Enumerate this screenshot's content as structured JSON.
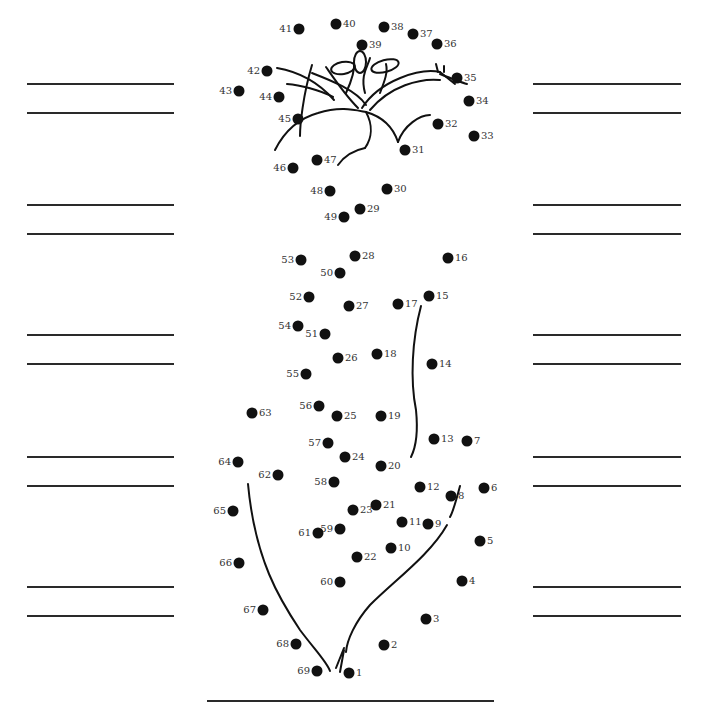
{
  "worksheet": {
    "answer_lines": {
      "left": {
        "x1": 27,
        "x2": 174,
        "ys": [
          84,
          113,
          205,
          234,
          335,
          364,
          457,
          486,
          587,
          616
        ]
      },
      "right": {
        "x1": 533,
        "x2": 681,
        "ys": [
          84,
          113,
          205,
          234,
          335,
          364,
          457,
          486,
          587,
          616
        ]
      },
      "bottom": {
        "x1": 207,
        "x2": 494,
        "y": 701
      }
    },
    "dots": [
      {
        "n": "1",
        "x": 349,
        "y": 673,
        "side": "r"
      },
      {
        "n": "2",
        "x": 384,
        "y": 645,
        "side": "r"
      },
      {
        "n": "3",
        "x": 426,
        "y": 619,
        "side": "r"
      },
      {
        "n": "4",
        "x": 462,
        "y": 581,
        "side": "r"
      },
      {
        "n": "5",
        "x": 480,
        "y": 541,
        "side": "r"
      },
      {
        "n": "6",
        "x": 484,
        "y": 488,
        "side": "r"
      },
      {
        "n": "7",
        "x": 467,
        "y": 441,
        "side": "r"
      },
      {
        "n": "8",
        "x": 451,
        "y": 496,
        "side": "r"
      },
      {
        "n": "9",
        "x": 428,
        "y": 524,
        "side": "r"
      },
      {
        "n": "10",
        "x": 391,
        "y": 548,
        "side": "r"
      },
      {
        "n": "11",
        "x": 402,
        "y": 522,
        "side": "r"
      },
      {
        "n": "12",
        "x": 420,
        "y": 487,
        "side": "r"
      },
      {
        "n": "13",
        "x": 434,
        "y": 439,
        "side": "r"
      },
      {
        "n": "14",
        "x": 432,
        "y": 364,
        "side": "r"
      },
      {
        "n": "15",
        "x": 429,
        "y": 296,
        "side": "r"
      },
      {
        "n": "16",
        "x": 448,
        "y": 258,
        "side": "r"
      },
      {
        "n": "17",
        "x": 398,
        "y": 304,
        "side": "r"
      },
      {
        "n": "18",
        "x": 377,
        "y": 354,
        "side": "r"
      },
      {
        "n": "19",
        "x": 381,
        "y": 416,
        "side": "r"
      },
      {
        "n": "20",
        "x": 381,
        "y": 466,
        "side": "r"
      },
      {
        "n": "21",
        "x": 376,
        "y": 505,
        "side": "r"
      },
      {
        "n": "22",
        "x": 357,
        "y": 557,
        "side": "r"
      },
      {
        "n": "23",
        "x": 353,
        "y": 510,
        "side": "r"
      },
      {
        "n": "24",
        "x": 345,
        "y": 457,
        "side": "r"
      },
      {
        "n": "25",
        "x": 337,
        "y": 416,
        "side": "r"
      },
      {
        "n": "26",
        "x": 338,
        "y": 358,
        "side": "r"
      },
      {
        "n": "27",
        "x": 349,
        "y": 306,
        "side": "r"
      },
      {
        "n": "28",
        "x": 355,
        "y": 256,
        "side": "r"
      },
      {
        "n": "29",
        "x": 360,
        "y": 209,
        "side": "r"
      },
      {
        "n": "30",
        "x": 387,
        "y": 189,
        "side": "r"
      },
      {
        "n": "31",
        "x": 405,
        "y": 150,
        "side": "r"
      },
      {
        "n": "32",
        "x": 438,
        "y": 124,
        "side": "r"
      },
      {
        "n": "33",
        "x": 474,
        "y": 136,
        "side": "r"
      },
      {
        "n": "34",
        "x": 469,
        "y": 101,
        "side": "r"
      },
      {
        "n": "35",
        "x": 457,
        "y": 78,
        "side": "r"
      },
      {
        "n": "36",
        "x": 437,
        "y": 44,
        "side": "r"
      },
      {
        "n": "37",
        "x": 413,
        "y": 34,
        "side": "r"
      },
      {
        "n": "38",
        "x": 384,
        "y": 27,
        "side": "r"
      },
      {
        "n": "39",
        "x": 362,
        "y": 45,
        "side": "r"
      },
      {
        "n": "40",
        "x": 336,
        "y": 24,
        "side": "r"
      },
      {
        "n": "41",
        "x": 299,
        "y": 29,
        "side": "l"
      },
      {
        "n": "42",
        "x": 267,
        "y": 71,
        "side": "l"
      },
      {
        "n": "43",
        "x": 239,
        "y": 91,
        "side": "l"
      },
      {
        "n": "44",
        "x": 279,
        "y": 97,
        "side": "l"
      },
      {
        "n": "45",
        "x": 298,
        "y": 119,
        "side": "l"
      },
      {
        "n": "46",
        "x": 293,
        "y": 168,
        "side": "l"
      },
      {
        "n": "47",
        "x": 317,
        "y": 160,
        "side": "r"
      },
      {
        "n": "48",
        "x": 330,
        "y": 191,
        "side": "l"
      },
      {
        "n": "49",
        "x": 344,
        "y": 217,
        "side": "l"
      },
      {
        "n": "50",
        "x": 340,
        "y": 273,
        "side": "l"
      },
      {
        "n": "51",
        "x": 325,
        "y": 334,
        "side": "l"
      },
      {
        "n": "52",
        "x": 309,
        "y": 297,
        "side": "l"
      },
      {
        "n": "53",
        "x": 301,
        "y": 260,
        "side": "l"
      },
      {
        "n": "54",
        "x": 298,
        "y": 326,
        "side": "l"
      },
      {
        "n": "55",
        "x": 306,
        "y": 374,
        "side": "l"
      },
      {
        "n": "56",
        "x": 319,
        "y": 406,
        "side": "l"
      },
      {
        "n": "57",
        "x": 328,
        "y": 443,
        "side": "l"
      },
      {
        "n": "58",
        "x": 334,
        "y": 482,
        "side": "l"
      },
      {
        "n": "59",
        "x": 340,
        "y": 529,
        "side": "l"
      },
      {
        "n": "60",
        "x": 340,
        "y": 582,
        "side": "l"
      },
      {
        "n": "61",
        "x": 318,
        "y": 533,
        "side": "l"
      },
      {
        "n": "62",
        "x": 278,
        "y": 475,
        "side": "l"
      },
      {
        "n": "63",
        "x": 252,
        "y": 413,
        "side": "r"
      },
      {
        "n": "64",
        "x": 238,
        "y": 462,
        "side": "l"
      },
      {
        "n": "65",
        "x": 233,
        "y": 511,
        "side": "l"
      },
      {
        "n": "66",
        "x": 239,
        "y": 563,
        "side": "l"
      },
      {
        "n": "67",
        "x": 263,
        "y": 610,
        "side": "l"
      },
      {
        "n": "68",
        "x": 296,
        "y": 644,
        "side": "l"
      },
      {
        "n": "69",
        "x": 317,
        "y": 671,
        "side": "l"
      }
    ],
    "colors": {
      "ink": "#111111",
      "label": "#333333",
      "line": "#2a2a2a",
      "paper": "#ffffff"
    }
  }
}
